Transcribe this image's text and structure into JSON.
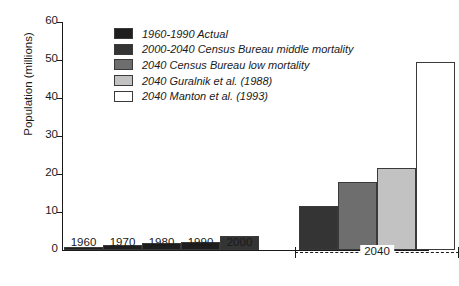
{
  "chart_data": {
    "type": "bar",
    "title": "",
    "xlabel": "",
    "ylabel": "Population (millions)",
    "ylim": [
      0,
      60
    ],
    "yticks": [
      0,
      10,
      20,
      30,
      40,
      50,
      60
    ],
    "ytick_labels": [
      "0",
      "10",
      "20",
      "30",
      "40",
      "50",
      "60"
    ],
    "grid": false,
    "legend_position": "upper-left-inside",
    "categories": [
      "1960",
      "1970",
      "1980",
      "1990",
      "2000",
      "2040",
      "2040",
      "2040",
      "2040"
    ],
    "values": [
      0.9,
      1.4,
      1.8,
      2.2,
      3.7,
      11.5,
      18.0,
      21.5,
      49.5
    ],
    "bars": [
      {
        "label": "1960",
        "value": 0.9,
        "series": "1960-1990 Actual",
        "color": "#1e1e1e"
      },
      {
        "label": "1970",
        "value": 1.4,
        "series": "1960-1990 Actual",
        "color": "#1e1e1e"
      },
      {
        "label": "1980",
        "value": 1.8,
        "series": "1960-1990 Actual",
        "color": "#1e1e1e"
      },
      {
        "label": "1990",
        "value": 2.2,
        "series": "1960-1990 Actual",
        "color": "#1e1e1e"
      },
      {
        "label": "2000",
        "value": 3.7,
        "series": "2000-2040 Census Bureau middle mortality",
        "color": "#343434"
      },
      {
        "label": "2040",
        "value": 11.5,
        "series": "2000-2040 Census Bureau middle mortality",
        "color": "#343434"
      },
      {
        "label": "2040",
        "value": 18.0,
        "series": "2040 Census Bureau low mortality",
        "color": "#6e6e6e"
      },
      {
        "label": "2040",
        "value": 21.5,
        "series": "2040 Guralnik et al. (1988)",
        "color": "#c2c2c2"
      },
      {
        "label": "2040",
        "value": 49.5,
        "series": "2040 Manton et al. (1993)",
        "color": "#ffffff"
      }
    ],
    "xtick_labels": [
      "1960",
      "1970",
      "1980",
      "1990",
      "2000"
    ],
    "group_bracket_label": "2040",
    "legend": [
      {
        "label": "1960-1990 Actual",
        "color": "#1e1e1e"
      },
      {
        "label": "2000-2040 Census Bureau middle mortality",
        "color": "#343434"
      },
      {
        "label": "2040 Census Bureau low mortality",
        "color": "#6e6e6e"
      },
      {
        "label": "2040 Guralnik et al. (1988)",
        "color": "#c2c2c2"
      },
      {
        "label": "2040 Manton et al. (1993)",
        "color": "#ffffff"
      }
    ]
  }
}
